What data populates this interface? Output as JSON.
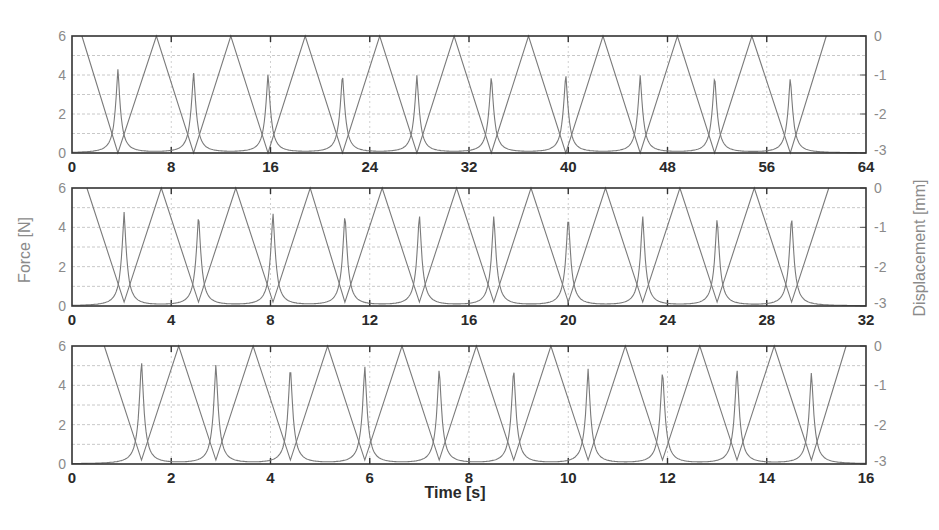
{
  "chart_data": [
    {
      "type": "line",
      "panel": 1,
      "title": "",
      "xlabel": "",
      "ylabel_left": "",
      "ylabel_right": "",
      "xlim": [
        0,
        64
      ],
      "ylim_left": [
        0,
        6
      ],
      "ylim_right": [
        -3,
        0
      ],
      "xticks": [
        "0",
        "8",
        "16",
        "24",
        "32",
        "40",
        "48",
        "56",
        "64"
      ],
      "yticks_left": [
        "0",
        "2",
        "4",
        "6"
      ],
      "yticks_right": [
        "-3",
        "-2",
        "-1",
        "0"
      ],
      "grid": true,
      "series": [
        {
          "name": "Force [N]",
          "axis": "left",
          "shape": "sharp peaks",
          "peak_times": [
            3.7,
            9.8,
            15.8,
            21.8,
            27.8,
            33.8,
            39.8,
            45.8,
            51.8,
            57.9
          ],
          "peak_values": [
            4.3,
            4.2,
            4.1,
            4.1,
            4.0,
            4.0,
            4.1,
            4.0,
            4.0,
            3.9
          ],
          "baseline": 0
        },
        {
          "name": "Displacement [mm]",
          "axis": "right",
          "shape": "triangle",
          "vertices_t": [
            0.8,
            3.7,
            6.8,
            9.8,
            12.8,
            15.8,
            18.8,
            21.8,
            24.8,
            27.8,
            30.8,
            33.8,
            36.8,
            39.8,
            42.8,
            45.8,
            48.8,
            51.8,
            54.8,
            57.9,
            60.8
          ],
          "vertices_v": [
            0,
            -3,
            0,
            -3,
            0,
            -3,
            0,
            -3,
            0,
            -3,
            0,
            -3,
            0,
            -3,
            0,
            -3,
            0,
            -3,
            0,
            -3,
            0
          ]
        }
      ]
    },
    {
      "type": "line",
      "panel": 2,
      "title": "",
      "xlabel": "",
      "ylabel_left": "Force [N]",
      "ylabel_right": "Displacement [mm]",
      "xlim": [
        0,
        32
      ],
      "ylim_left": [
        0,
        6
      ],
      "ylim_right": [
        -3,
        0
      ],
      "xticks": [
        "0",
        "4",
        "8",
        "12",
        "16",
        "20",
        "24",
        "28",
        "32"
      ],
      "yticks_left": [
        "0",
        "2",
        "4",
        "6"
      ],
      "yticks_right": [
        "-3",
        "-2",
        "-1",
        "0"
      ],
      "grid": true,
      "series": [
        {
          "name": "Force [N]",
          "axis": "left",
          "shape": "sharp peaks",
          "peak_times": [
            2.1,
            5.1,
            8.1,
            11.0,
            14.0,
            17.0,
            20.0,
            23.0,
            26.0,
            29.0
          ],
          "peak_values": [
            4.8,
            4.7,
            4.8,
            4.7,
            4.7,
            4.6,
            4.6,
            4.6,
            4.5,
            4.6
          ],
          "baseline": 0
        },
        {
          "name": "Displacement [mm]",
          "axis": "right",
          "shape": "triangle",
          "vertices_t": [
            0.6,
            2.1,
            3.6,
            5.1,
            6.6,
            8.1,
            9.6,
            11.0,
            12.5,
            14.0,
            15.5,
            17.0,
            18.5,
            20.0,
            21.5,
            23.0,
            24.5,
            26.0,
            27.5,
            29.0,
            30.5
          ],
          "vertices_v": [
            0,
            -2.9,
            0,
            -2.9,
            0,
            -2.9,
            0,
            -2.9,
            0,
            -2.9,
            0,
            -2.9,
            0,
            -2.9,
            0,
            -2.9,
            0,
            -2.9,
            0,
            -2.9,
            0
          ]
        }
      ]
    },
    {
      "type": "line",
      "panel": 3,
      "title": "",
      "xlabel": "Time [s]",
      "ylabel_left": "",
      "ylabel_right": "",
      "xlim": [
        0,
        16
      ],
      "ylim_left": [
        0,
        6
      ],
      "ylim_right": [
        -3,
        0
      ],
      "xticks": [
        "0",
        "2",
        "4",
        "6",
        "8",
        "10",
        "12",
        "14",
        "16"
      ],
      "yticks_left": [
        "0",
        "2",
        "4",
        "6"
      ],
      "yticks_right": [
        "-3",
        "-2",
        "-1",
        "0"
      ],
      "grid": true,
      "series": [
        {
          "name": "Force [N]",
          "axis": "left",
          "shape": "sharp peaks",
          "peak_times": [
            1.4,
            2.9,
            4.4,
            5.9,
            7.4,
            8.9,
            10.4,
            11.9,
            13.4,
            14.9
          ],
          "peak_values": [
            5.3,
            5.1,
            5.0,
            5.0,
            4.9,
            4.9,
            4.8,
            4.8,
            4.9,
            4.7
          ],
          "baseline": 0
        },
        {
          "name": "Displacement [mm]",
          "axis": "right",
          "shape": "triangle",
          "vertices_t": [
            0.65,
            1.4,
            2.15,
            2.9,
            3.65,
            4.4,
            5.15,
            5.9,
            6.65,
            7.4,
            8.15,
            8.9,
            9.65,
            10.4,
            11.15,
            11.9,
            12.65,
            13.4,
            14.15,
            14.9,
            15.6
          ],
          "vertices_v": [
            0,
            -2.9,
            0,
            -2.9,
            0,
            -2.9,
            0,
            -2.9,
            0,
            -2.9,
            0,
            -2.9,
            0,
            -2.9,
            0,
            -2.9,
            0,
            -2.9,
            0,
            -2.9,
            0
          ]
        }
      ]
    }
  ],
  "labels": {
    "ylabel_left": "Force [N]",
    "ylabel_right": "Displacement [mm]",
    "xlabel": "Time [s]"
  },
  "colors": {
    "force_line": "#7a7a7a",
    "displacement_line": "#7a7a7a",
    "frame": "#333333",
    "grid": "#c8c8c8",
    "tick_y": "#8a8a8a",
    "tick_x": "#2a2a2a"
  }
}
